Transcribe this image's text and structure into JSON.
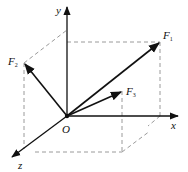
{
  "diagram": {
    "type": "3d-force-vectors",
    "origin": {
      "label": "O",
      "x": 67,
      "y": 116
    },
    "axes": [
      {
        "name": "x",
        "label": "x",
        "from": [
          67,
          116
        ],
        "to": [
          178,
          116
        ],
        "label_pos": [
          170,
          120
        ]
      },
      {
        "name": "y",
        "label": "y",
        "from": [
          67,
          116
        ],
        "to": [
          67,
          6
        ],
        "label_pos": [
          56,
          6
        ]
      },
      {
        "name": "z",
        "label": "z",
        "from": [
          67,
          116
        ],
        "to": [
          11,
          158
        ],
        "label_pos": [
          17,
          159
        ]
      }
    ],
    "vectors": [
      {
        "name": "F1",
        "label": "F",
        "sub": "1",
        "tip": [
          160,
          42
        ],
        "label_pos": [
          163,
          29
        ]
      },
      {
        "name": "F2",
        "label": "F",
        "sub": "2",
        "tip": [
          24,
          63
        ],
        "label_pos": [
          8,
          56
        ]
      },
      {
        "name": "F3",
        "label": "F",
        "sub": "3",
        "tip": [
          122,
          91
        ],
        "label_pos": [
          126,
          86
        ]
      }
    ],
    "colors": {
      "line": "#111111",
      "dashed": "#999999",
      "background": "#ffffff"
    }
  }
}
